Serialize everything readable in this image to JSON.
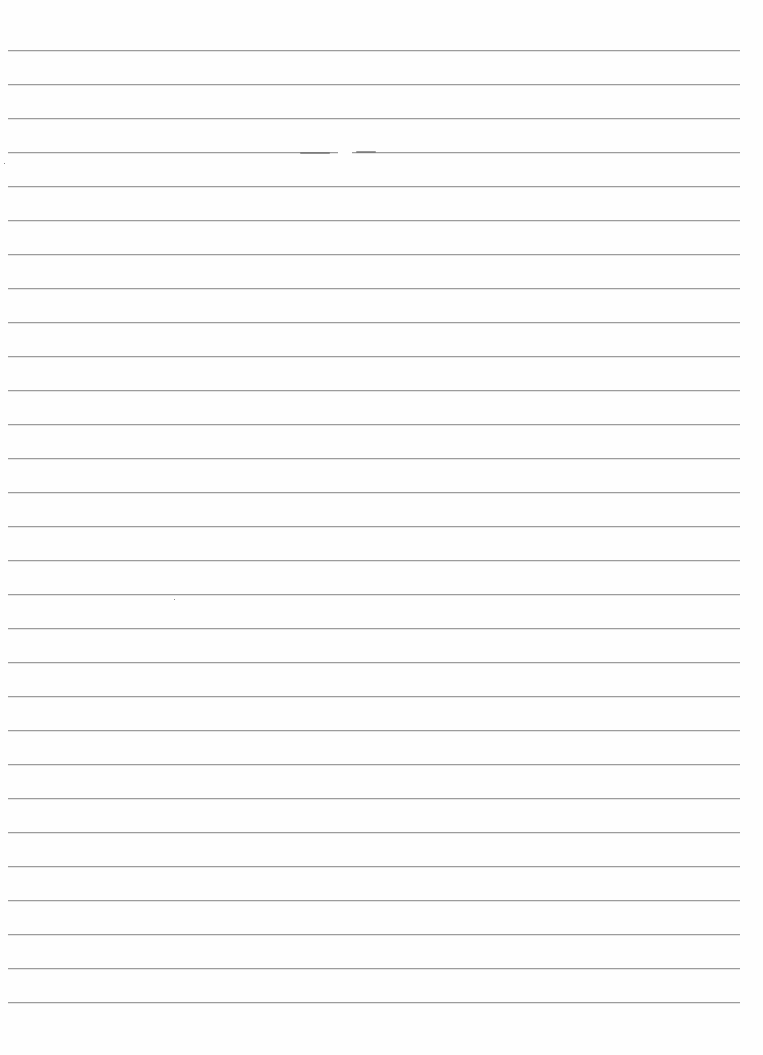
{
  "page": {
    "type": "lined-paper",
    "background_color": "#fefefe",
    "rule_color": "#9c9c9c",
    "rule_count": 29,
    "first_rule_y": 50,
    "rule_spacing": 34,
    "rule_left": 8,
    "rule_width": 732,
    "lines": [
      {
        "text": ""
      },
      {
        "text": ""
      },
      {
        "text": ""
      },
      {
        "text": ""
      },
      {
        "text": ""
      },
      {
        "text": ""
      },
      {
        "text": ""
      },
      {
        "text": ""
      },
      {
        "text": ""
      },
      {
        "text": ""
      },
      {
        "text": ""
      },
      {
        "text": ""
      },
      {
        "text": ""
      },
      {
        "text": ""
      },
      {
        "text": ""
      },
      {
        "text": ""
      },
      {
        "text": ""
      },
      {
        "text": ""
      },
      {
        "text": ""
      },
      {
        "text": ""
      },
      {
        "text": ""
      },
      {
        "text": ""
      },
      {
        "text": ""
      },
      {
        "text": ""
      },
      {
        "text": ""
      },
      {
        "text": ""
      },
      {
        "text": ""
      },
      {
        "text": ""
      },
      {
        "text": ""
      }
    ]
  }
}
